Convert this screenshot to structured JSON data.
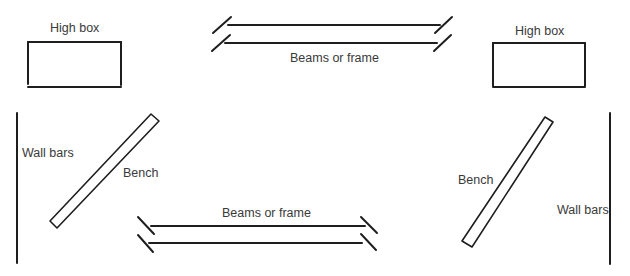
{
  "diagram": {
    "type": "gym layout diagram",
    "stroke_color": "#1e1e1e",
    "label_color": "#3a3a3a",
    "labels": {
      "high_box_left": "High box",
      "high_box_right": "High box",
      "beams_top": "Beams or frame",
      "beams_bottom": "Beams or frame",
      "wall_bars_left": "Wall bars",
      "wall_bars_right": "Wall bars",
      "bench_left": "Bench",
      "bench_right": "Bench"
    },
    "elements": [
      {
        "kind": "high-box",
        "label": "High box",
        "position": "top-left"
      },
      {
        "kind": "beams",
        "label": "Beams or frame",
        "position": "top-center"
      },
      {
        "kind": "high-box",
        "label": "High box",
        "position": "top-right"
      },
      {
        "kind": "wall-bars",
        "label": "Wall bars",
        "position": "left"
      },
      {
        "kind": "bench",
        "label": "Bench",
        "position": "left-center",
        "orientation": "diagonal"
      },
      {
        "kind": "beams",
        "label": "Beams or frame",
        "position": "bottom-center"
      },
      {
        "kind": "bench",
        "label": "Bench",
        "position": "right-center",
        "orientation": "diagonal"
      },
      {
        "kind": "wall-bars",
        "label": "Wall bars",
        "position": "right"
      }
    ]
  }
}
